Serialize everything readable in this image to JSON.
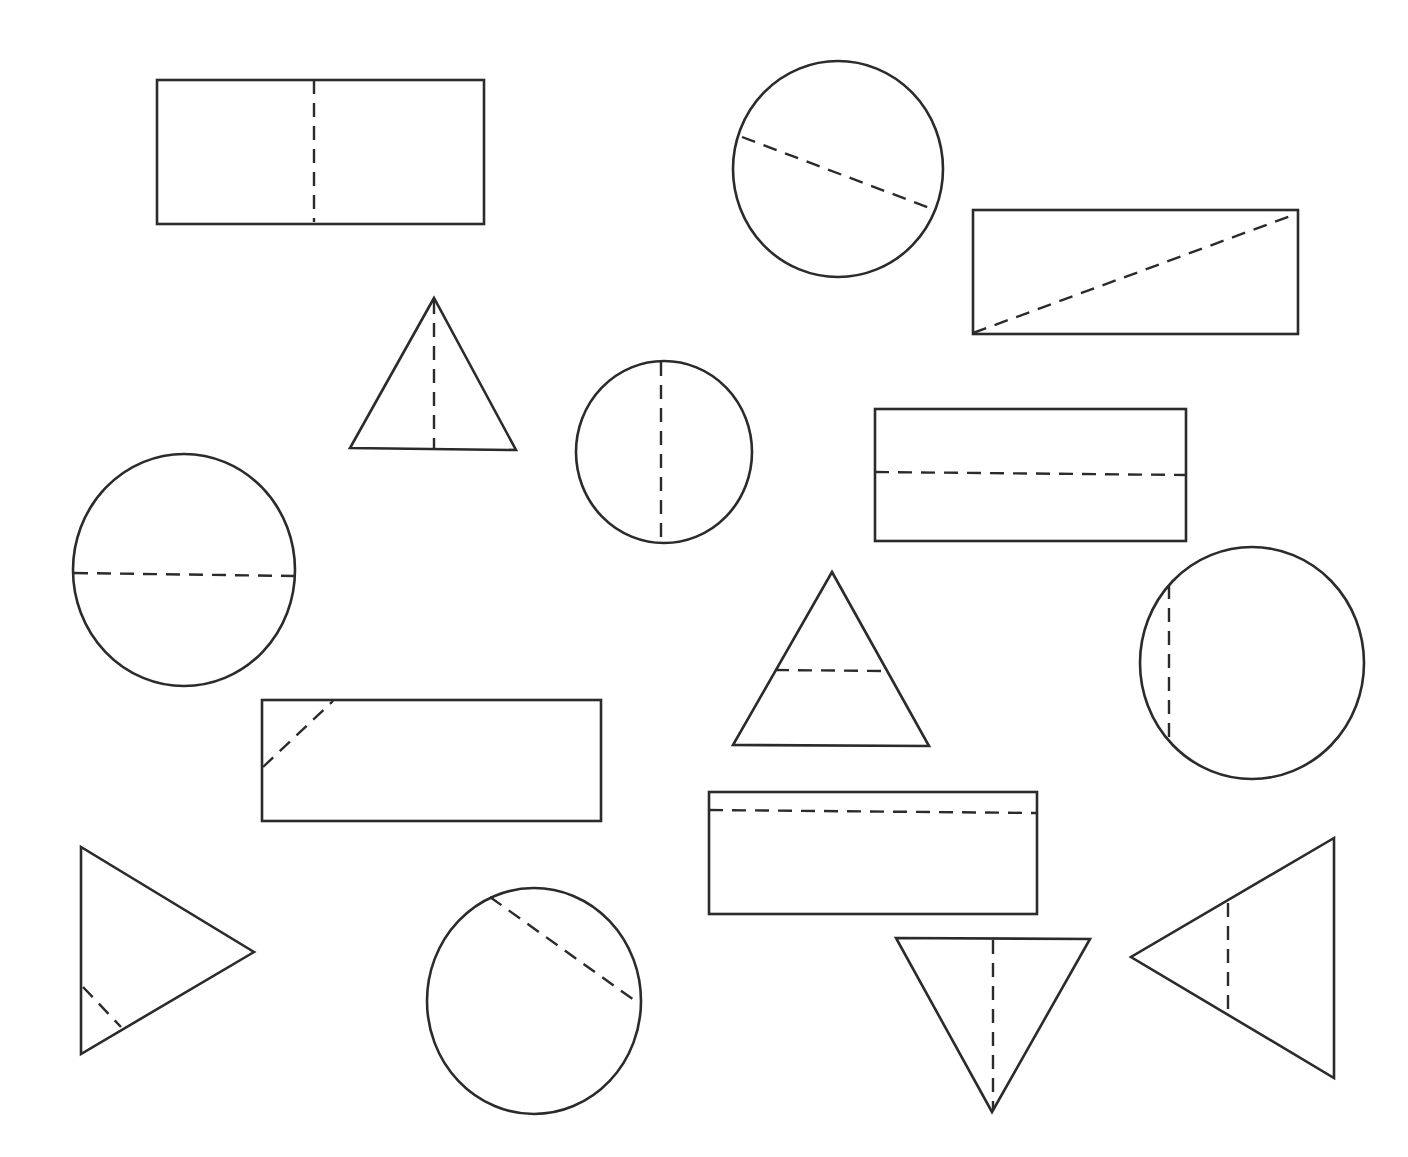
{
  "worksheet": {
    "background": "#ffffff",
    "stroke_color": "#2b2b2b",
    "shapes": [
      {
        "id": "rect-1",
        "kind": "rect",
        "x": 157,
        "y": 80,
        "w": 327,
        "h": 144,
        "fold": [
          314,
          80,
          314,
          222
        ],
        "fold_type": "vertical-center"
      },
      {
        "id": "circle-1",
        "kind": "ellipse",
        "cx": 838,
        "cy": 169,
        "rx": 105,
        "ry": 108,
        "fold": [
          742,
          137,
          935,
          210
        ],
        "fold_type": "diagonal-off-center"
      },
      {
        "id": "rect-2",
        "kind": "rect",
        "x": 973,
        "y": 210,
        "w": 325,
        "h": 124,
        "fold": [
          973,
          333,
          1296,
          214
        ],
        "fold_type": "diagonal"
      },
      {
        "id": "tri-1",
        "kind": "polygon",
        "points": "434,298 350,448 516,450",
        "fold": [
          434,
          300,
          434,
          448
        ],
        "fold_type": "vertical-center"
      },
      {
        "id": "circle-2",
        "kind": "ellipse",
        "cx": 664,
        "cy": 452,
        "rx": 88,
        "ry": 91,
        "fold": [
          661,
          362,
          661,
          542
        ],
        "fold_type": "vertical-center"
      },
      {
        "id": "rect-3",
        "kind": "rect",
        "x": 875,
        "y": 409,
        "w": 311,
        "h": 132,
        "fold": [
          875,
          472,
          1186,
          475
        ],
        "fold_type": "horizontal-center"
      },
      {
        "id": "circle-3",
        "kind": "ellipse",
        "cx": 184,
        "cy": 570,
        "rx": 111,
        "ry": 116,
        "fold": [
          74,
          573,
          294,
          576
        ],
        "fold_type": "horizontal-center"
      },
      {
        "id": "tri-2",
        "kind": "polygon",
        "points": "832,572 733,745 929,746",
        "fold": [
          775,
          670,
          884,
          671
        ],
        "fold_type": "horizontal-off-center"
      },
      {
        "id": "circle-4",
        "kind": "ellipse",
        "cx": 1252,
        "cy": 663,
        "rx": 112,
        "ry": 116,
        "fold": [
          1169,
          585,
          1169,
          737
        ],
        "fold_type": "vertical-off-center"
      },
      {
        "id": "rect-4",
        "kind": "rect",
        "x": 262,
        "y": 700,
        "w": 339,
        "h": 121,
        "fold": [
          263,
          767,
          333,
          701
        ],
        "fold_type": "corner-diagonal"
      },
      {
        "id": "rect-5",
        "kind": "rect",
        "x": 709,
        "y": 792,
        "w": 328,
        "h": 122,
        "fold": [
          709,
          810,
          1036,
          813
        ],
        "fold_type": "horizontal-off-center"
      },
      {
        "id": "tri-3",
        "kind": "polygon",
        "points": "81,847 81,1054 254,952",
        "fold": [
          83,
          987,
          121,
          1027
        ],
        "fold_type": "corner-diagonal"
      },
      {
        "id": "circle-5",
        "kind": "ellipse",
        "cx": 534,
        "cy": 1001,
        "rx": 107,
        "ry": 113,
        "fold": [
          490,
          897,
          634,
          1000
        ],
        "fold_type": "diagonal-off-center"
      },
      {
        "id": "tri-4",
        "kind": "polygon",
        "points": "896,938 1090,939 992,1112",
        "fold": [
          993,
          940,
          993,
          1110
        ],
        "fold_type": "vertical-center"
      },
      {
        "id": "tri-5",
        "kind": "polygon",
        "points": "1334,838 1131,957 1334,1078",
        "fold": [
          1228,
          903,
          1228,
          1011
        ],
        "fold_type": "vertical-off-center"
      }
    ]
  }
}
